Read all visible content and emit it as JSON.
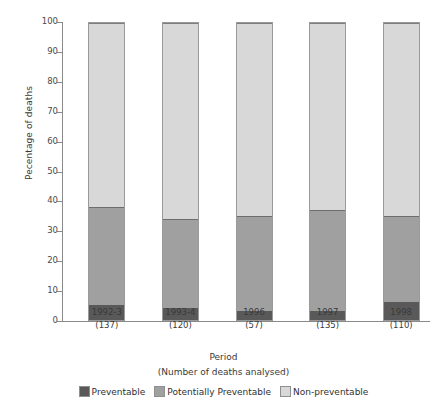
{
  "chart_data": {
    "type": "bar",
    "subtype": "stacked-100",
    "title": "",
    "xlabel": "Period",
    "xlabel_sub": "(Number of deaths analysed)",
    "ylabel": "Pecentage of deaths",
    "ylim": [
      0,
      100
    ],
    "ytick_values": [
      0,
      10,
      20,
      30,
      40,
      50,
      60,
      70,
      80,
      90,
      100
    ],
    "ytick_labels": [
      "0",
      "10",
      "20",
      "30",
      "40",
      "50",
      "60",
      "70",
      "80",
      "90",
      "100"
    ],
    "grid": false,
    "legend_position": "bottom",
    "categories": [
      "1992-3",
      "1993-4",
      "1996",
      "1997",
      "1998"
    ],
    "category_counts": [
      "(137)",
      "(120)",
      "(57)",
      "(135)",
      "(110)"
    ],
    "series": [
      {
        "name": "Preventable",
        "color": "#595959",
        "values": [
          5,
          4,
          3,
          3,
          6
        ]
      },
      {
        "name": "Potentially Preventable",
        "color": "#a0a0a0",
        "values": [
          33,
          30,
          32,
          34,
          29
        ]
      },
      {
        "name": "Non-preventable",
        "color": "#d8d8d8",
        "values": [
          62,
          66,
          65,
          63,
          65
        ]
      }
    ],
    "cumulative_tops": [
      {
        "category": "1992-3",
        "preventable_top": 5,
        "potentially_top": 38,
        "total": 100
      },
      {
        "category": "1993-4",
        "preventable_top": 4,
        "potentially_top": 34,
        "total": 100
      },
      {
        "category": "1996",
        "preventable_top": 3,
        "potentially_top": 35,
        "total": 100
      },
      {
        "category": "1997",
        "preventable_top": 3,
        "potentially_top": 37,
        "total": 100
      },
      {
        "category": "1998",
        "preventable_top": 6,
        "potentially_top": 35,
        "total": 100
      }
    ]
  }
}
